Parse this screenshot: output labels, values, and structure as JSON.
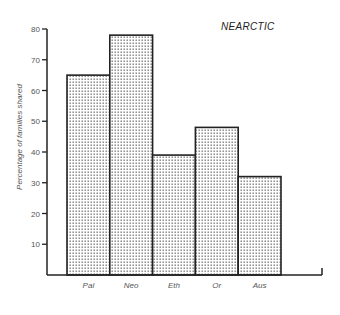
{
  "chart_data": {
    "type": "bar",
    "title": "NEARCTIC",
    "xlabel": "",
    "ylabel": "Percentage of families shared",
    "categories": [
      "Pal",
      "Neo",
      "Eth",
      "Or",
      "Aus"
    ],
    "values": [
      65,
      78,
      39,
      48,
      32
    ],
    "ylim": [
      0,
      80
    ],
    "yticks": [
      10,
      20,
      30,
      40,
      50,
      60,
      70,
      80
    ],
    "ytick_labels": [
      "10",
      "20",
      "30",
      "40",
      "50",
      "60",
      "70",
      "80"
    ],
    "grid": false,
    "legend": "none",
    "bar_fill": "stippled",
    "colors": {
      "bar_edge": "#222222",
      "axis": "#222222",
      "dots": "#777777"
    }
  }
}
